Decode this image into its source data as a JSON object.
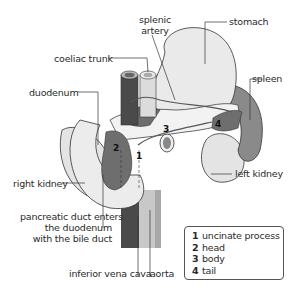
{
  "diagram": {
    "labels": {
      "splenic_artery": "splenic\nartery",
      "splenic_artery_line1": "splenic",
      "splenic_artery_line2": "artery",
      "stomach": "stomach",
      "coeliac_trunk": "coeliac trunk",
      "duodenum": "duodenum",
      "spleen": "spleen",
      "right_kidney": "right kidney",
      "left_kidney": "left kidney",
      "pancreatic_duct_line1": "pancreatic duct enters",
      "pancreatic_duct_line2": "the duodenum",
      "pancreatic_duct_line3": "with the bile duct",
      "inferior_vena_cava": "inferior vena cava",
      "aorta": "aorta"
    },
    "region_markers": [
      "1",
      "2",
      "3",
      "4"
    ],
    "legend": [
      {
        "num": "1",
        "label": "uncinate process"
      },
      {
        "num": "2",
        "label": "head"
      },
      {
        "num": "3",
        "label": "body"
      },
      {
        "num": "4",
        "label": "tail"
      }
    ],
    "colors": {
      "pancreas": "#6e6e6e",
      "dark_vessel": "#4a4a4a",
      "light_vessel": "#c8c8c8",
      "organ_fill": "#e6e6e6",
      "outline": "#333333"
    }
  }
}
